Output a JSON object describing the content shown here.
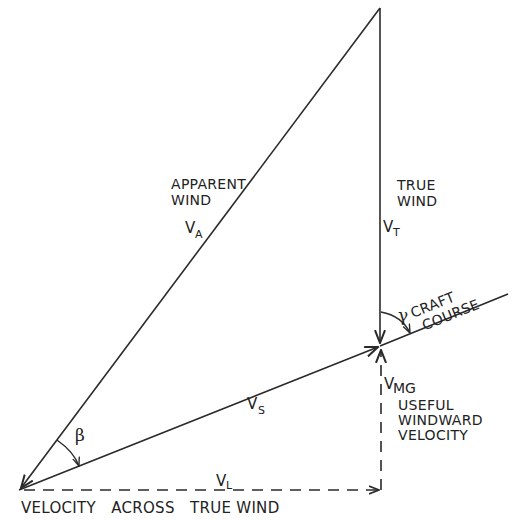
{
  "diagram": {
    "type": "velocity-vector-triangle",
    "labels": {
      "apparent_wind": {
        "line1": "APPARENT",
        "line2": "WIND",
        "symbol": "V",
        "subscript": "A"
      },
      "true_wind": {
        "line1": "TRUE",
        "line2": "WIND",
        "symbol": "V",
        "subscript": "T"
      },
      "craft_course": {
        "greek": "γ",
        "line1": "CRAFT",
        "line2": "COURSE"
      },
      "boat_velocity": {
        "symbol": "V",
        "subscript": "S"
      },
      "vmg": {
        "symbol": "V",
        "subscript": "MG",
        "line1": "USEFUL",
        "line2": "WINDWARD",
        "line3": "VELOCITY"
      },
      "leeway_angle": {
        "greek": "β"
      },
      "lateral": {
        "symbol": "V",
        "subscript": "L"
      },
      "bottom_caption": "VELOCITY   ACROSS   TRUE WIND"
    },
    "colors": {
      "ink": "#2a2a2a",
      "background": "#ffffff"
    }
  }
}
